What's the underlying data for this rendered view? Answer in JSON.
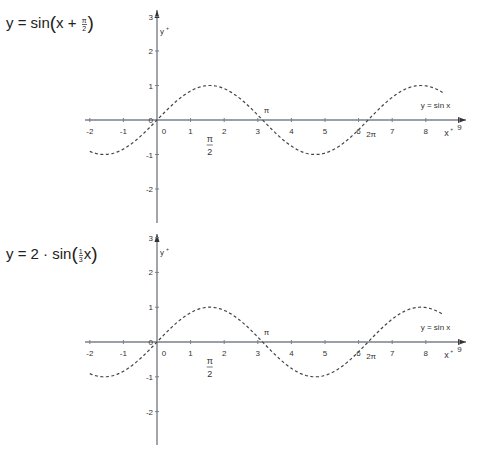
{
  "charts": [
    {
      "title": {
        "prefix": "y = sin",
        "inner_prefix": "x + ",
        "frac_num": "π",
        "frac_den": "2",
        "suffix": ""
      },
      "curve_label": "y = sin x",
      "x_axis_label": "x",
      "y_axis_label": "y",
      "x_ticks": [
        "-2",
        "-1",
        "0",
        "1",
        "2",
        "3",
        "4",
        "5",
        "6",
        "7",
        "8",
        "9"
      ],
      "y_ticks": [
        "3",
        "2",
        "1",
        "0",
        "-1",
        "-2"
      ],
      "annotations": {
        "half_pi_num": "π",
        "half_pi_den": "2",
        "pi": "π",
        "two_pi": "2π"
      }
    },
    {
      "title": {
        "prefix": "y = 2 · sin",
        "inner_prefix": "",
        "frac_num": "1",
        "frac_den": "3",
        "suffix": "x"
      },
      "curve_label": "y = sin x",
      "x_axis_label": "x",
      "y_axis_label": "y",
      "x_ticks": [
        "-2",
        "-1",
        "0",
        "1",
        "2",
        "3",
        "4",
        "5",
        "6",
        "7",
        "8",
        "9"
      ],
      "y_ticks": [
        "3",
        "2",
        "1",
        "0",
        "-1",
        "-2"
      ],
      "annotations": {
        "half_pi_num": "π",
        "half_pi_den": "2",
        "pi": "π",
        "two_pi": "2π"
      }
    }
  ],
  "chart_data": [
    {
      "type": "line",
      "title": "y = sin(x + π/2)",
      "xlabel": "x",
      "ylabel": "y",
      "xlim": [
        -2,
        9
      ],
      "ylim": [
        -2.7,
        3.2
      ],
      "grid": false,
      "series": [
        {
          "name": "y = sin x",
          "style": "dashed",
          "function": "sin(x)",
          "domain": [
            -2,
            8.5
          ],
          "x": [
            -2,
            -1.5708,
            -1,
            0,
            1,
            1.5708,
            2,
            3,
            3.1416,
            4,
            4.7124,
            5,
            6,
            6.2832,
            7,
            7.854,
            8,
            8.5
          ],
          "values": [
            -0.91,
            -1,
            -0.84,
            0,
            0.84,
            1,
            0.91,
            0.14,
            0,
            -0.76,
            -1,
            -0.96,
            -0.28,
            0,
            0.66,
            1,
            0.99,
            0.8
          ]
        }
      ],
      "annotations": [
        "π/2",
        "π",
        "2π",
        "y = sin x"
      ]
    },
    {
      "type": "line",
      "title": "y = 2 · sin((1/3) x)",
      "xlabel": "x",
      "ylabel": "y",
      "xlim": [
        -2,
        9
      ],
      "ylim": [
        -2.7,
        3.2
      ],
      "grid": false,
      "series": [
        {
          "name": "y = sin x",
          "style": "dashed",
          "function": "sin(x)",
          "domain": [
            -2,
            8.5
          ],
          "x": [
            -2,
            -1.5708,
            -1,
            0,
            1,
            1.5708,
            2,
            3,
            3.1416,
            4,
            4.7124,
            5,
            6,
            6.2832,
            7,
            7.854,
            8,
            8.5
          ],
          "values": [
            -0.91,
            -1,
            -0.84,
            0,
            0.84,
            1,
            0.91,
            0.14,
            0,
            -0.76,
            -1,
            -0.96,
            -0.28,
            0,
            0.66,
            1,
            0.99,
            0.8
          ]
        }
      ],
      "annotations": [
        "π/2",
        "π",
        "2π",
        "y = sin x"
      ]
    }
  ]
}
